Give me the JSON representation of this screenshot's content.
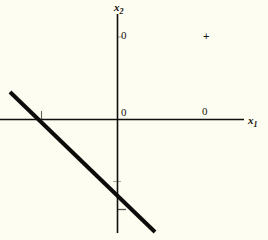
{
  "figure": {
    "background_color": "#fdfdf2",
    "ink_color": "#100f0c"
  },
  "axes": {
    "x_axis": {
      "name": "x",
      "subscript": "1",
      "label_text": "x1"
    },
    "y_axis": {
      "name": "x",
      "subscript": "2",
      "label_text": "x2"
    }
  },
  "labels": {
    "y_axis_tick": "0",
    "origin": "0",
    "x_axis_tick": "0"
  },
  "markers": {
    "plus": "+"
  },
  "chart_data": {
    "type": "line",
    "title": "",
    "xlabel": "x1",
    "ylabel": "x2",
    "grid": false,
    "legend": null,
    "origin_px": [
      117,
      119
    ],
    "xlim_px": [
      0,
      244
    ],
    "ylim_px": [
      14,
      233
    ],
    "series": [
      {
        "name": "constraint-line",
        "type": "line",
        "style": "solid-thick",
        "points_px": [
          [
            10,
            92
          ],
          [
            155,
            232
          ]
        ],
        "x_intercept_px": 41,
        "y_intercept_px": 210,
        "stroke_width": 4
      },
      {
        "name": "point-marker",
        "type": "scatter",
        "marker": "+",
        "points_px": [
          [
            207,
            36
          ]
        ]
      }
    ],
    "tick_marks_px": {
      "x_axis": [
        41
      ],
      "y_axis": [
        37,
        181,
        210
      ]
    },
    "tick_labels": {
      "x_axis": [
        "0",
        "0"
      ],
      "y_axis": [
        "0"
      ]
    }
  }
}
